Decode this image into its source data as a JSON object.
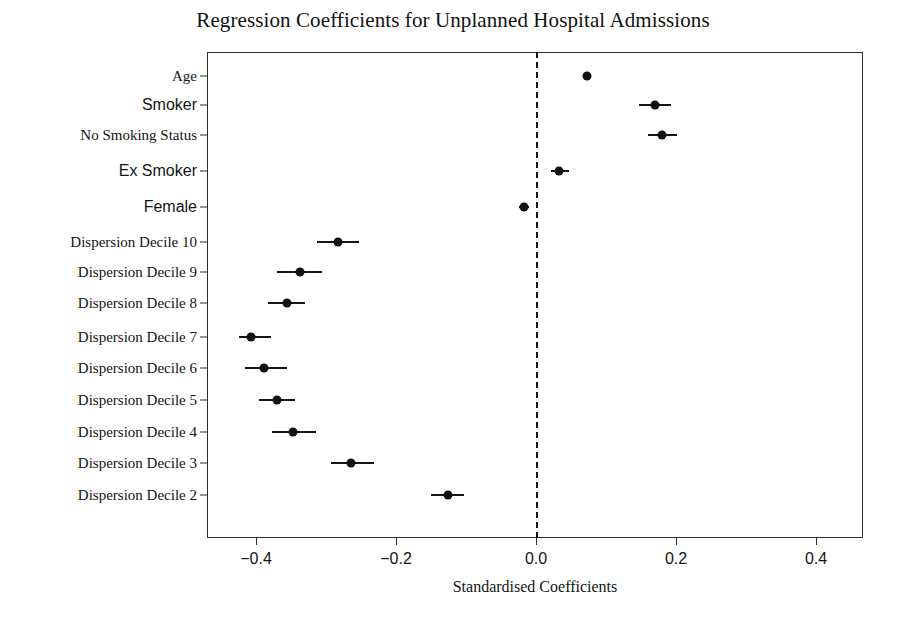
{
  "chart_data": {
    "type": "scatter",
    "title": "Regression Coefficients for Unplanned Hospital Admissions",
    "xlabel": "Standardised Coefficients",
    "ylabel": "",
    "xlim": [
      -0.47,
      0.47
    ],
    "xticks": [
      -0.4,
      -0.2,
      0.0,
      0.2,
      0.4
    ],
    "xticklabels": [
      "−0.4",
      "−0.2",
      "0.0",
      "0.2",
      "0.4"
    ],
    "grid": false,
    "legend": null,
    "reference_line": {
      "x": 0.0,
      "style": "dashed",
      "color": "#111111"
    },
    "categories": [
      "Age",
      "Smoker",
      "No Smoking Status",
      "Ex Smoker",
      "Female",
      "Dispersion Decile 10",
      "Dispersion Decile 9",
      "Dispersion Decile 8",
      "Dispersion Decile 7",
      "Dispersion Decile 6",
      "Dispersion Decile 5",
      "Dispersion Decile 4",
      "Dispersion Decile 3",
      "Dispersion Decile 2"
    ],
    "label_fonts": [
      "serif",
      "sans",
      "serif",
      "sans",
      "sans",
      "serif",
      "serif",
      "serif",
      "serif",
      "serif",
      "serif",
      "serif",
      "serif",
      "serif"
    ],
    "values": [
      0.073,
      0.17,
      0.18,
      0.033,
      -0.017,
      -0.283,
      -0.337,
      -0.356,
      -0.407,
      -0.389,
      -0.37,
      -0.347,
      -0.264,
      -0.126
    ],
    "ci_low": [
      0.068,
      0.147,
      0.16,
      0.021,
      -0.024,
      -0.313,
      -0.37,
      -0.383,
      -0.424,
      -0.416,
      -0.396,
      -0.377,
      -0.293,
      -0.15
    ],
    "ci_high": [
      0.078,
      0.193,
      0.201,
      0.047,
      -0.01,
      -0.253,
      -0.306,
      -0.33,
      -0.379,
      -0.356,
      -0.344,
      -0.314,
      -0.231,
      -0.103
    ],
    "point_color": "#121212",
    "line_color": "#151515"
  },
  "axis_geometry": {
    "plot_left_px": 207,
    "plot_right_px": 863,
    "plot_top_px": 52,
    "plot_bottom_px": 538,
    "x_zero_px": 536,
    "px_per_unit": 700,
    "row_y_px": [
      76,
      105,
      135,
      171,
      207,
      242,
      272,
      303,
      337,
      368,
      400,
      432,
      463,
      495
    ]
  }
}
